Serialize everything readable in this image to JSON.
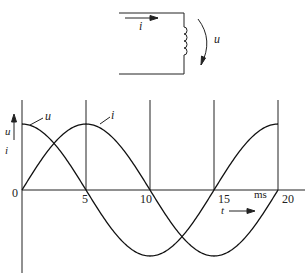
{
  "circuit": {
    "current_label": "i",
    "voltage_label": "u",
    "element": "inductor"
  },
  "chart_data": {
    "type": "line",
    "title": "",
    "xlabel": "t",
    "xunit": "ms",
    "ylabel_top": "u",
    "ylabel_bottom": "i",
    "origin_label": "0",
    "x_ticks": [
      0,
      5,
      10,
      15,
      20
    ],
    "x_tick_labels": [
      "0",
      "5",
      "10",
      "15",
      "20"
    ],
    "xlim": [
      0,
      20
    ],
    "ylim": [
      -1,
      1
    ],
    "period_ms": 20,
    "series": [
      {
        "name": "u",
        "shape": "cosine",
        "x": [
          0,
          5,
          10,
          15,
          20
        ],
        "values": [
          1,
          0,
          -1,
          0,
          1
        ]
      },
      {
        "name": "i",
        "shape": "sine",
        "x": [
          0,
          5,
          10,
          15,
          20
        ],
        "values": [
          0,
          1,
          0,
          -1,
          0
        ]
      }
    ],
    "grid": "vertical lines at 5, 10, 15, 20 ms (positive half only)"
  }
}
